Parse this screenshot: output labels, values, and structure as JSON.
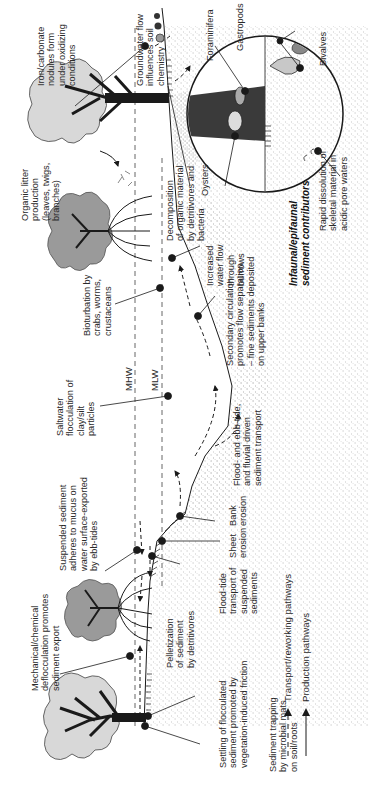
{
  "diagram": {
    "type": "process-diagram",
    "orientation": "rotated-90-ccw",
    "water_levels": [
      {
        "id": "mhw",
        "label": "MHW"
      },
      {
        "id": "mlw",
        "label": "MLW"
      }
    ],
    "labels": {
      "sediment_trapping": "Sediment trapping\nby microbial mats\non soil/roots",
      "settling_flocculated": "Settling of flocculated\nsediment promoted by\nvegetation-induced friction",
      "mechanical_defloc": "Mechanical/chemical\ndeflocculation promotes\nsediment export",
      "pelletization": "Pelletization\nof sediment\nby detritivores",
      "flood_tide_transport": "Flood-tide\ntransport of\nsuspended\nsediments",
      "suspended_mucus": "Suspended sediment\nadheres to mucus on\nwater surface-exported\nby ebb-tides",
      "sheet_erosion": "Sheet\nerosion",
      "bank_erosion": "Bank\nerosion",
      "flood_ebb_fluvial": "Flood- and ebb-tide,\nand fluvial driven\nsediment transport",
      "saltwater_floc": "Saltwater\nflocculation of\nclay/silt\nparticles",
      "secondary_circulation": "Secondary circulation\npromotes flow separation\n– fine sediments deposited\non upper banks",
      "bioturbation": "Bioturbation by\ncrabs, worms,\ncrustaceans",
      "increased_water_flow": "Increased\nwater flow\nthrough\nburrows",
      "organic_litter": "Organic litter\nproduction\n(leaves, twigs,\nbranches)",
      "decomposition": "Decomposition\nof organic material\nby detritivores and\nbacteria",
      "iron_carbonate": "Iron/carbonate\nnodules form\nunder oxidizing\nconditions",
      "groundwater": "Groundwater flow\ninfluences soil\nchemistry",
      "foraminifera": "Foraminifera",
      "gastropods": "Gastropods",
      "bivalves": "Bivalves",
      "oysters": "Oysters",
      "rapid_dissolution": "Rapid dissolution of\nskeletal material in\nacidic pore waters",
      "infaunal_title": "Infaunal/epifaunal\nsediment contributors"
    },
    "legend": [
      {
        "style": "dashed-arrow",
        "label": "Transport/reworking pathways"
      },
      {
        "style": "solid-arrow",
        "label": "Production pathways"
      }
    ],
    "colors": {
      "ink": "#1a1a1a",
      "canopy_light": "#d8d8d8",
      "canopy_dark": "#9a9a9a",
      "sediment_stipple": "#bdbdbd",
      "text": "#2a2a2a"
    }
  }
}
